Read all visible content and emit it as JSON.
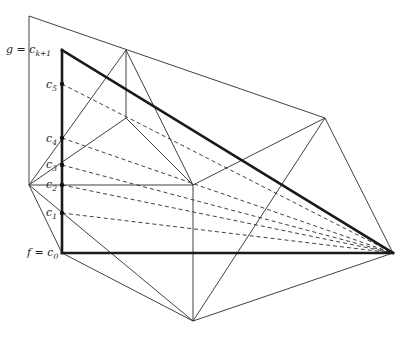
{
  "figure": {
    "colors": {
      "line": "#2b2b2b",
      "thick": "#1a1a1a",
      "background": "#ffffff"
    },
    "vertices": {
      "A": [
        29,
        16
      ],
      "B": [
        126,
        50
      ],
      "C": [
        325,
        118
      ],
      "D": [
        393,
        253
      ],
      "E": [
        193,
        321
      ],
      "F": [
        29,
        185
      ],
      "G": [
        193,
        185
      ],
      "H": [
        126,
        118
      ],
      "T": [
        62,
        50
      ],
      "c0": [
        62,
        253
      ]
    },
    "chain_points": [
      {
        "name": "c5",
        "y": 84
      },
      {
        "name": "c4",
        "y": 138
      },
      {
        "name": "c3",
        "y": 165
      },
      {
        "name": "c2",
        "y": 185
      },
      {
        "name": "c1",
        "y": 213
      }
    ],
    "labels": {
      "top": {
        "lhs": "g = c",
        "sub": "k+1"
      },
      "bottom": {
        "lhs": "f = c",
        "sub": "0"
      },
      "c5": {
        "base": "c",
        "sub": "5"
      },
      "c4": {
        "base": "c",
        "sub": "4"
      },
      "c3": {
        "base": "c",
        "sub": "3"
      },
      "c2": {
        "base": "c",
        "sub": "2"
      },
      "c1": {
        "base": "c",
        "sub": "1"
      }
    }
  }
}
